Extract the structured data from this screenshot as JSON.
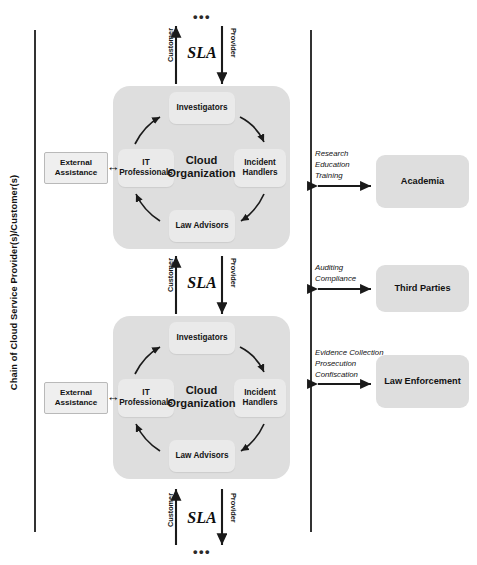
{
  "diagram": {
    "chain_label": "Chain of Cloud Service Provider(s)/Customer(s)",
    "ellipsis": "•••",
    "sla": {
      "label": "SLA",
      "up_arrow_label": "Customer",
      "down_arrow_label": "Provider"
    },
    "external_assistance": {
      "label": "External Assistance",
      "arrow_glyph": "↔"
    },
    "cloud_org": {
      "center_label": "Cloud Organization",
      "roles": [
        {
          "id": "investigators",
          "label": "Investigators",
          "position": "top"
        },
        {
          "id": "incident-handlers",
          "label": "Incident Handlers",
          "position": "right"
        },
        {
          "id": "law-advisors",
          "label": "Law Advisors",
          "position": "bottom"
        },
        {
          "id": "it-professionals",
          "label": "IT Professionals",
          "position": "left"
        }
      ]
    },
    "instances": [
      {
        "id": "cloud-org-1",
        "order": 1
      },
      {
        "id": "cloud-org-2",
        "order": 2
      }
    ],
    "external_entities": [
      {
        "id": "academia",
        "label": "Academia",
        "relations": "Research\nEducation\nTraining",
        "relation_lines": [
          "Research",
          "Education",
          "Training"
        ]
      },
      {
        "id": "third-parties",
        "label": "Third Parties",
        "relations": "Auditing\nCompliance",
        "relation_lines": [
          "Auditing",
          "Compliance"
        ]
      },
      {
        "id": "law-enforcement",
        "label": "Law Enforcement",
        "relations": "Evidence Collection\nProsecution\nConfiscation",
        "relation_lines": [
          "Evidence Collection",
          "Prosecution",
          "Confiscation"
        ]
      }
    ],
    "colors": {
      "container_gray": "#dedede",
      "role_box_gray": "#eaeaea",
      "line_dark": "#333333",
      "text_dark": "#121212",
      "page_background": "#ffffff"
    }
  }
}
